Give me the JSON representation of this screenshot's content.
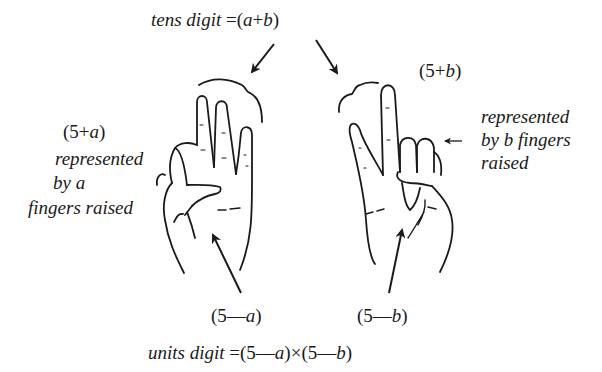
{
  "diagram": {
    "title_top": {
      "prefix": "tens digit",
      "equals": "=",
      "expr_open": "(",
      "var1": "a",
      "op": "+",
      "var2": "b",
      "expr_close": ")"
    },
    "left_hand": {
      "value_label": {
        "open": "(5",
        "op": "+",
        "var": "a",
        "close": ")"
      },
      "description_lines": [
        "represented",
        "by a",
        "fingers raised"
      ],
      "bottom_label": {
        "open": "(5",
        "op": "—",
        "var": "a",
        "close": ")"
      }
    },
    "right_hand": {
      "value_label": {
        "open": "(5",
        "op": "+",
        "var": "b",
        "close": ")"
      },
      "description_lines": [
        "represented",
        "by b fingers",
        "raised"
      ],
      "bottom_label": {
        "open": "(5",
        "op": "—",
        "var": "b",
        "close": ")"
      }
    },
    "title_bottom": {
      "prefix": "units digit",
      "equals": "=",
      "term1_open": "(5",
      "term1_op": "—",
      "term1_var": "a",
      "term1_close": ")",
      "times": "×",
      "term2_open": "(5",
      "term2_op": "—",
      "term2_var": "b",
      "term2_close": ")"
    }
  }
}
